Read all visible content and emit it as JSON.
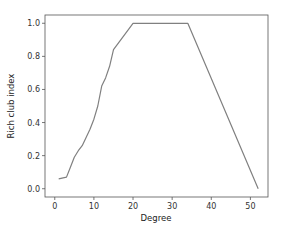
{
  "chart_data": {
    "type": "line",
    "title": "",
    "xlabel": "Degree",
    "ylabel": "Rich club index",
    "xlim": [
      -2.5,
      54.5
    ],
    "ylim": [
      -0.05,
      1.05
    ],
    "x_ticks": [
      0,
      10,
      20,
      30,
      40,
      50
    ],
    "y_ticks": [
      0.0,
      0.2,
      0.4,
      0.6,
      0.8,
      1.0
    ],
    "x_tick_labels": [
      "0",
      "10",
      "20",
      "30",
      "40",
      "50"
    ],
    "y_tick_labels": [
      "0.0",
      "0.2",
      "0.4",
      "0.6",
      "0.8",
      "1.0"
    ],
    "grid": false,
    "legend": null,
    "series": [
      {
        "name": "rich club coefficient",
        "color": "#808080",
        "x": [
          1,
          3,
          4,
          5,
          6,
          7,
          8,
          9,
          10,
          11,
          12,
          13,
          14,
          15,
          20,
          34,
          52
        ],
        "values": [
          0.06,
          0.07,
          0.13,
          0.19,
          0.23,
          0.26,
          0.31,
          0.36,
          0.42,
          0.5,
          0.62,
          0.67,
          0.74,
          0.84,
          1.0,
          1.0,
          0.0
        ]
      }
    ]
  },
  "colors": {
    "line": "#808080",
    "axes": "#555555",
    "background": "#ffffff"
  }
}
